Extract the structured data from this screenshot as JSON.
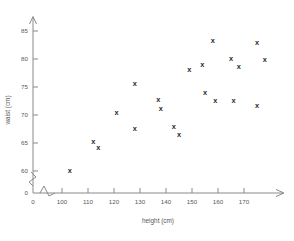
{
  "chart_data": {
    "type": "scatter",
    "title": "",
    "xlabel": "height (cm)",
    "ylabel": "waist (cm)",
    "xlim": [
      95,
      178
    ],
    "ylim": [
      57,
      87
    ],
    "grid": false,
    "legend": "none",
    "marker_glyph": "x",
    "marker_color": "#2b2b2b",
    "axis_color": "#8a8a8a",
    "axis_break_x": true,
    "axis_break_y": true,
    "xticks": [
      0,
      100,
      110,
      120,
      130,
      140,
      150,
      160,
      170
    ],
    "yticks": [
      0,
      60,
      65,
      70,
      75,
      80,
      85
    ],
    "points": [
      {
        "x": 103,
        "y": 60.1
      },
      {
        "x": 112,
        "y": 65.2
      },
      {
        "x": 114,
        "y": 64.2
      },
      {
        "x": 121,
        "y": 70.4
      },
      {
        "x": 128,
        "y": 75.6
      },
      {
        "x": 128,
        "y": 67.6
      },
      {
        "x": 137,
        "y": 72.8
      },
      {
        "x": 138,
        "y": 71.2
      },
      {
        "x": 143,
        "y": 67.9
      },
      {
        "x": 145,
        "y": 66.5
      },
      {
        "x": 149,
        "y": 78.1
      },
      {
        "x": 154,
        "y": 79.1
      },
      {
        "x": 155,
        "y": 74.0
      },
      {
        "x": 158,
        "y": 83.4
      },
      {
        "x": 159,
        "y": 72.6
      },
      {
        "x": 165,
        "y": 80.1
      },
      {
        "x": 166,
        "y": 72.6
      },
      {
        "x": 168,
        "y": 78.6
      },
      {
        "x": 175,
        "y": 82.9
      },
      {
        "x": 175,
        "y": 71.8
      },
      {
        "x": 178,
        "y": 79.9
      }
    ]
  },
  "axes": {
    "x_title": "height (cm)",
    "y_title": "waist (cm)",
    "x_tick_labels": [
      "0",
      "100",
      "110",
      "120",
      "130",
      "140",
      "150",
      "160",
      "170"
    ],
    "y_tick_labels": [
      "0",
      "60",
      "65",
      "70",
      "75",
      "80",
      "85"
    ]
  }
}
